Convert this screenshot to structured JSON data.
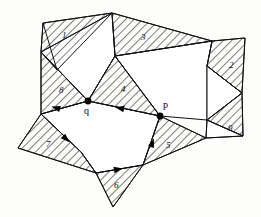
{
  "figure": {
    "background_color": "#fdfdfb",
    "ink_color": "#111111",
    "hatch_color": "#111111",
    "width": 261,
    "height": 217
  },
  "points": [
    {
      "id": "q",
      "label": "q",
      "x": 88,
      "y": 101,
      "label_x": 84,
      "label_y": 114,
      "marker": "filled-dot"
    },
    {
      "id": "p",
      "label": "p",
      "x": 160,
      "y": 116,
      "label_x": 163,
      "label_y": 108,
      "marker": "filled-dot"
    }
  ],
  "regions": [
    {
      "id": "r1",
      "label": "1",
      "label_x": 62,
      "label_y": 38,
      "fill": "hatched",
      "points": "41,52 43,23 112,13 57,70"
    },
    {
      "id": "r2",
      "label": "2",
      "label_x": 229,
      "label_y": 68,
      "fill": "hatched",
      "points": "212,41 245,38 242,93 207,66"
    },
    {
      "id": "r3",
      "label": "3",
      "label_x": 141,
      "label_y": 40,
      "fill": "hatched",
      "points": "112,13 212,41 128,54 115,56"
    },
    {
      "id": "r4",
      "label": "4",
      "label_x": 121,
      "label_y": 92,
      "fill": "hatched",
      "points": "115,56 160,116 88,101"
    },
    {
      "id": "r5",
      "label": "5",
      "label_x": 166,
      "label_y": 148,
      "fill": "hatched",
      "points": "160,116 206,138 143,165"
    },
    {
      "id": "r6",
      "label": "6",
      "label_x": 114,
      "label_y": 188,
      "fill": "hatched",
      "points": "96,173 143,165 113,207"
    },
    {
      "id": "r7",
      "label": "7",
      "label_x": 46,
      "label_y": 147,
      "fill": "hatched",
      "points": "41,114 81,152 96,173 18,148"
    },
    {
      "id": "r8",
      "label": "8",
      "label_x": 59,
      "label_y": 93,
      "fill": "hatched",
      "points": "41,52 88,101 41,114"
    },
    {
      "id": "r9",
      "label": "9",
      "label_x": 228,
      "label_y": 131,
      "fill": "hatched",
      "points": "207,120 242,93 243,136"
    }
  ],
  "white_faces": [
    {
      "id": "wf-upper-left",
      "points": "41,52 112,13 115,56 88,101"
    },
    {
      "id": "wf-upper-right",
      "points": "115,56 128,54 212,41 207,66 207,120 160,116"
    },
    {
      "id": "wf-center",
      "points": "41,114 88,101 160,116 143,165 96,173 81,152"
    },
    {
      "id": "wf-right-notch",
      "points": "207,120 242,93 207,66"
    },
    {
      "id": "wf-lower-right",
      "points": "206,138 243,136 207,120"
    }
  ],
  "edges": [
    {
      "id": "edge-q-left",
      "from": "88,101",
      "to": "41,114",
      "directed": true,
      "arrow_x": 60,
      "arrow_y": 109,
      "arrow_angle": 196
    },
    {
      "id": "edge-p-q",
      "from": "160,116",
      "to": "88,101",
      "directed": true,
      "arrow_x": 124,
      "arrow_y": 109,
      "arrow_angle": 192
    },
    {
      "id": "edge-left-down",
      "from": "41,114",
      "to": "81,152",
      "directed": true,
      "arrow_x": 65,
      "arrow_y": 138,
      "arrow_angle": 44
    },
    {
      "id": "edge-bottom",
      "from": "96,173",
      "to": "143,165",
      "directed": true,
      "arrow_x": 114,
      "arrow_y": 170,
      "arrow_angle": -10
    },
    {
      "id": "edge-right-up",
      "from": "143,165",
      "to": "160,116",
      "directed": true,
      "arrow_x": 150,
      "arrow_y": 145,
      "arrow_angle": -71
    }
  ],
  "legend": {
    "hatch_meaning": "hatched region",
    "dot_meaning": "marked vertex"
  }
}
